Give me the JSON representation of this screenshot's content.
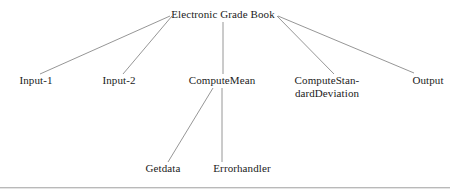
{
  "diagram": {
    "type": "hierarchy-tree",
    "line_color": "#8a8a8a",
    "text_color": "#1b1b1b",
    "background_color": "#ffffff",
    "rule_color": "#b9b9b9",
    "root": {
      "id": "electronic-grade-book",
      "label": "Electronic Grade Book",
      "x": 223,
      "y": 18
    },
    "nodes": [
      {
        "id": "input-1",
        "label": "Input-1",
        "line2": "",
        "x": 36,
        "y": 84,
        "level": 2
      },
      {
        "id": "input-2",
        "label": "Input-2",
        "line2": "",
        "x": 119,
        "y": 84,
        "level": 2
      },
      {
        "id": "compute-mean",
        "label": "ComputeMean",
        "line2": "",
        "x": 222,
        "y": 84,
        "level": 2
      },
      {
        "id": "compute-standard-deviation",
        "label": "ComputeStan-",
        "line2": "dardDeviation",
        "x": 327,
        "y": 84,
        "level": 2
      },
      {
        "id": "output",
        "label": "Output",
        "line2": "",
        "x": 428,
        "y": 84,
        "level": 2
      },
      {
        "id": "getdata",
        "label": "Getdata",
        "line2": "",
        "x": 163,
        "y": 172,
        "level": 3
      },
      {
        "id": "errorhandler",
        "label": "Errorhandler",
        "line2": "",
        "x": 242,
        "y": 172,
        "level": 3
      }
    ],
    "edges": [
      {
        "id": "edge-root-input-1",
        "from": "electronic-grade-book",
        "to": "input-1",
        "x1": 170,
        "y1": 16,
        "x2": 40,
        "y2": 74
      },
      {
        "id": "edge-root-input-2",
        "from": "electronic-grade-book",
        "to": "input-2",
        "x1": 172,
        "y1": 16,
        "x2": 123,
        "y2": 74
      },
      {
        "id": "edge-root-compute-mean",
        "from": "electronic-grade-book",
        "to": "compute-mean",
        "x1": 223,
        "y1": 22,
        "x2": 223,
        "y2": 74
      },
      {
        "id": "edge-root-compute-standard-deviation",
        "from": "electronic-grade-book",
        "to": "compute-standard-deviation",
        "x1": 277,
        "y1": 16,
        "x2": 334,
        "y2": 74
      },
      {
        "id": "edge-root-output",
        "from": "electronic-grade-book",
        "to": "output",
        "x1": 278,
        "y1": 16,
        "x2": 414,
        "y2": 73
      },
      {
        "id": "edge-compute-mean-getdata",
        "from": "compute-mean",
        "to": "getdata",
        "x1": 213,
        "y1": 88,
        "x2": 168,
        "y2": 162
      },
      {
        "id": "edge-compute-mean-errorhandler",
        "from": "compute-mean",
        "to": "errorhandler",
        "x1": 222,
        "y1": 88,
        "x2": 222,
        "y2": 162
      }
    ],
    "bottom_rule": {
      "y": 187
    }
  }
}
